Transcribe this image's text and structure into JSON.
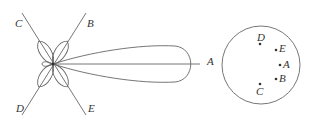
{
  "diagram": {
    "pattern": {
      "center": [
        53,
        64
      ],
      "axis_labels": [
        "A",
        "B",
        "C",
        "D",
        "E"
      ],
      "main_lobe_label": "A",
      "diagonal_labels": {
        "upper_left": "C",
        "upper_right": "B",
        "lower_left": "D",
        "lower_right": "E"
      }
    },
    "projection": {
      "shape": "circle",
      "points": [
        {
          "label": "D",
          "pos": "top"
        },
        {
          "label": "E",
          "pos": "upper-right"
        },
        {
          "label": "A",
          "pos": "right"
        },
        {
          "label": "B",
          "pos": "lower-right"
        },
        {
          "label": "C",
          "pos": "bottom"
        }
      ]
    },
    "colors": {
      "stroke": "#555555",
      "text": "#333333"
    }
  }
}
